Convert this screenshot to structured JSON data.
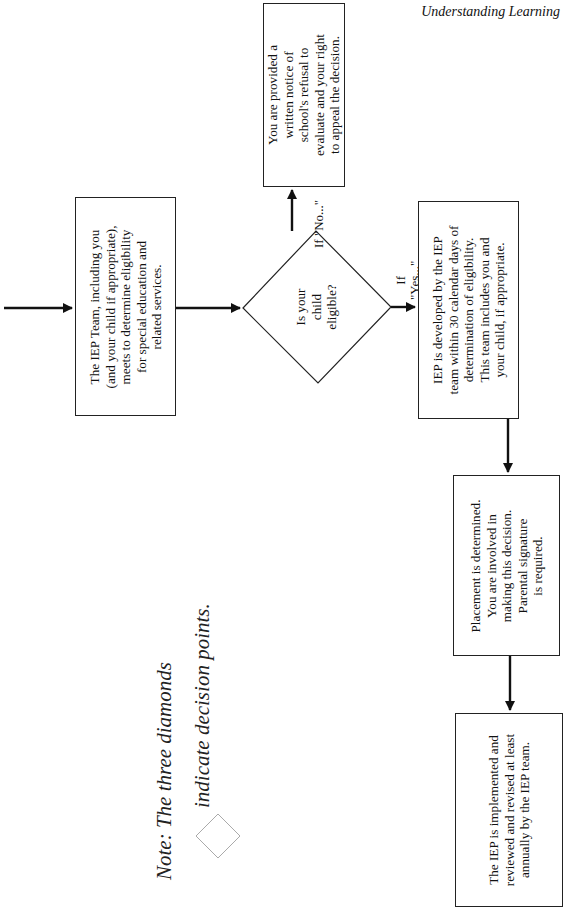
{
  "header": {
    "title": "Understanding Learning"
  },
  "nodes": {
    "iep_team": "The IEP Team, including you\n(and your child if appropriate),\nmeets to determine eligibility\nfor special education and\nrelated services.",
    "decision": "Is your\nchild\neligible?",
    "refusal_notice": "You are provided a\nwritten notice of\nschool's refusal to\nevaluate and your right\nto appeal the decision.",
    "iep_developed": "IEP is developed by the IEP\nteam within 30 calendar days of\ndetermination of eligibility.\nThis team includes you and\nyour child, if appropriate.",
    "placement": "Placement is determined.\nYou are involved in\nmaking this decision.\nParental signature\nis required.",
    "implemented": "The IEP is implemented and\nreviewed and revised at least\nannually by the IEP team."
  },
  "edges": {
    "no_label": "If \"No...\"",
    "yes_label": "If\n\"Yes...\""
  },
  "note": {
    "line1": "Note: The three diamonds",
    "line2": "indicate decision points."
  }
}
